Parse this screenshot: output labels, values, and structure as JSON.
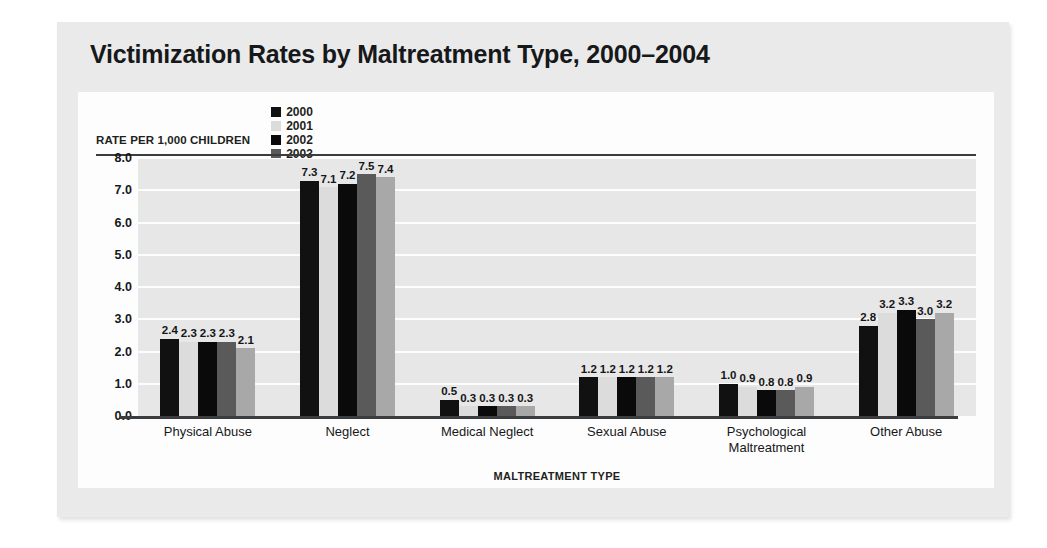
{
  "title": "Victimization Rates by Maltreatment Type, 2000–2004",
  "legend": {
    "axis_caption": "RATE PER 1,000 CHILDREN",
    "items": [
      {
        "label": "2000",
        "color": "#111111"
      },
      {
        "label": "2001",
        "color": "#dcdcdc"
      },
      {
        "label": "2002",
        "color": "#0a0a0a"
      },
      {
        "label": "2003",
        "color": "#5a5a5a"
      },
      {
        "label": "2004",
        "color": "#a8a8a8"
      }
    ]
  },
  "chart_data": {
    "type": "bar",
    "title": "Victimization Rates by Maltreatment Type, 2000–2004",
    "xlabel": "MALTREATMENT TYPE",
    "ylabel": "RATE PER 1,000 CHILDREN",
    "ylim": [
      0,
      8
    ],
    "ytick_labels": [
      "8.0",
      "7.0",
      "6.0",
      "5.0",
      "4.0",
      "3.0",
      "2.0",
      "1.0",
      "0.0"
    ],
    "ytick_values": [
      8,
      7,
      6,
      5,
      4,
      3,
      2,
      1,
      0
    ],
    "grid": true,
    "legend_position": "top",
    "categories": [
      "Physical Abuse",
      "Neglect",
      "Medical Neglect",
      "Sexual Abuse",
      "Psychological\nMaltreatment",
      "Other Abuse"
    ],
    "series": [
      {
        "name": "2000",
        "color": "#111111",
        "values": [
          2.4,
          7.3,
          0.5,
          1.2,
          1.0,
          2.8
        ]
      },
      {
        "name": "2001",
        "color": "#dcdcdc",
        "values": [
          2.3,
          7.1,
          0.3,
          1.2,
          0.9,
          3.2
        ]
      },
      {
        "name": "2002",
        "color": "#0a0a0a",
        "values": [
          2.3,
          7.2,
          0.3,
          1.2,
          0.8,
          3.3
        ]
      },
      {
        "name": "2003",
        "color": "#5a5a5a",
        "values": [
          2.3,
          7.5,
          0.3,
          1.2,
          0.8,
          3.0
        ]
      },
      {
        "name": "2004",
        "color": "#a8a8a8",
        "values": [
          2.1,
          7.4,
          0.3,
          1.2,
          0.9,
          3.2
        ]
      }
    ],
    "value_labels": [
      [
        "2.4",
        "2.3",
        "2.3",
        "2.3",
        "2.1"
      ],
      [
        "7.3",
        "7.1",
        "7.2",
        "7.5",
        "7.4"
      ],
      [
        "0.5",
        "0.3",
        "0.3",
        "0.3",
        "0.3"
      ],
      [
        "1.2",
        "1.2",
        "1.2",
        "1.2",
        "1.2"
      ],
      [
        "1.0",
        "0.9",
        "0.8",
        "0.8",
        "0.9"
      ],
      [
        "2.8",
        "3.2",
        "3.3",
        "3.0",
        "3.2"
      ]
    ]
  }
}
